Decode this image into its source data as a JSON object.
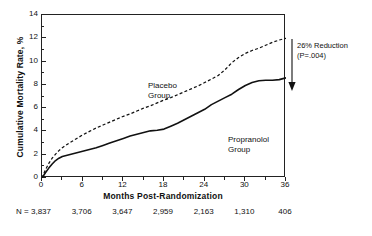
{
  "chart_data": {
    "type": "line",
    "title": "",
    "xlabel": "Months Post-Randomization",
    "ylabel": "Cumulative Mortality Rate, %",
    "xlim": [
      0,
      36
    ],
    "ylim": [
      0,
      14
    ],
    "xticks": [
      0,
      6,
      12,
      18,
      24,
      30,
      36
    ],
    "xtick_labels": [
      "0",
      "6",
      "12",
      "18",
      "24",
      "30",
      "36"
    ],
    "yticks": [
      0,
      2,
      4,
      6,
      8,
      10,
      12,
      14
    ],
    "ytick_labels": [
      "0",
      "2",
      "4",
      "6",
      "8",
      "10",
      "12",
      "14"
    ],
    "grid": false,
    "legend": "inline-labels",
    "series": [
      {
        "name": "Placebo Group",
        "style": "dashed",
        "color": "#111111",
        "label_position": "inside-left",
        "x": [
          0,
          0.5,
          1,
          1.5,
          2,
          2.5,
          3,
          4,
          5,
          6,
          7,
          8,
          9,
          10,
          11,
          12,
          13,
          14,
          15,
          16,
          17,
          18,
          19,
          20,
          21,
          22,
          23,
          24,
          25,
          26,
          27,
          28,
          29,
          30,
          31,
          32,
          33,
          34,
          35,
          36
        ],
        "y": [
          0,
          0.7,
          1.25,
          1.7,
          2.05,
          2.35,
          2.6,
          3.0,
          3.35,
          3.7,
          4.0,
          4.3,
          4.55,
          4.8,
          5.05,
          5.3,
          5.5,
          5.75,
          6.0,
          6.2,
          6.45,
          6.7,
          6.9,
          7.15,
          7.4,
          7.65,
          7.9,
          8.2,
          8.5,
          8.8,
          9.3,
          9.9,
          10.35,
          10.7,
          10.95,
          11.15,
          11.4,
          11.65,
          11.85,
          12.0
        ]
      },
      {
        "name": "Propranolol Group",
        "style": "solid",
        "color": "#111111",
        "label_position": "inside-right",
        "x": [
          0,
          0.5,
          1,
          1.5,
          2,
          2.5,
          3,
          4,
          5,
          6,
          7,
          8,
          9,
          10,
          11,
          12,
          13,
          14,
          15,
          16,
          17,
          18,
          19,
          20,
          21,
          22,
          23,
          24,
          25,
          26,
          27,
          28,
          29,
          30,
          31,
          32,
          33,
          34,
          35,
          36
        ],
        "y": [
          0,
          0.45,
          0.85,
          1.2,
          1.5,
          1.7,
          1.85,
          2.0,
          2.15,
          2.3,
          2.45,
          2.6,
          2.8,
          3.0,
          3.2,
          3.4,
          3.6,
          3.75,
          3.9,
          4.05,
          4.1,
          4.2,
          4.45,
          4.7,
          5.0,
          5.3,
          5.6,
          5.9,
          6.3,
          6.6,
          6.9,
          7.2,
          7.6,
          7.95,
          8.2,
          8.35,
          8.4,
          8.4,
          8.45,
          8.6
        ]
      }
    ],
    "annotations": [
      {
        "name": "reduction-annotation",
        "text": "26% Reduction\n(P=.004)",
        "line1": "26% Reduction",
        "line2": "(P=.004)",
        "arrow": "down-arrow-at-36-months"
      }
    ],
    "at_risk_table": {
      "row_label": "N =",
      "at_months": [
        0,
        6,
        12,
        18,
        24,
        30,
        36
      ],
      "values": [
        "3,837",
        "3,706",
        "3,647",
        "2,959",
        "2,163",
        "1,310",
        "406"
      ]
    }
  },
  "labels": {
    "placebo": "Placebo\nGroup",
    "propranolol": "Propranolol\nGroup"
  }
}
